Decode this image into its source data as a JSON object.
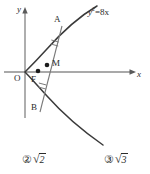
{
  "figure": {
    "name": "parabola-focal-chord-diagram",
    "curve_label": {
      "text": "y²=8x",
      "base": "y",
      "exponent": "2",
      "rest": "=8x"
    },
    "axes": {
      "x_label": "x",
      "y_label": "y",
      "origin_label": "O",
      "x_axis_color": "#8c8c8c",
      "y_axis_color": "#8c8c8c"
    },
    "points": [
      {
        "id": "A",
        "label": "A",
        "x": 62,
        "y": 26,
        "label_x": 54,
        "label_y": 16
      },
      {
        "id": "F",
        "label": "F",
        "x": 38,
        "y": 71,
        "label_x": 31,
        "label_y": 76
      },
      {
        "id": "M",
        "label": "M",
        "x": 46,
        "y": 65,
        "label_x": 51,
        "label_y": 60
      },
      {
        "id": "B",
        "label": "B",
        "x": 40,
        "y": 112,
        "label_x": 31,
        "label_y": 104
      }
    ],
    "chord": {
      "from": "A",
      "to": "B",
      "tick_marks": 2,
      "color": "#6b6b6b"
    },
    "curve_color": "#3a3a3a",
    "directrix_segment": {
      "visible": false
    }
  },
  "choices": [
    {
      "marker": "②",
      "radical": "√",
      "value": "2",
      "full": "② √2"
    },
    {
      "marker": "③",
      "radical": "√",
      "value": "3",
      "full": "③ √3"
    }
  ]
}
